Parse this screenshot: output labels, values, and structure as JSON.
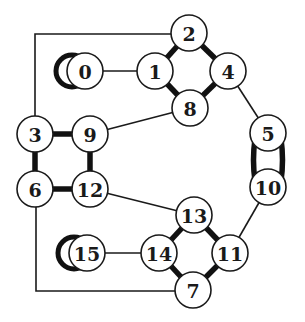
{
  "diagram": {
    "type": "graph",
    "node_radius": 18,
    "nodes": [
      {
        "id": "0",
        "label": "0",
        "x": 85,
        "y": 71
      },
      {
        "id": "1",
        "label": "1",
        "x": 155,
        "y": 71
      },
      {
        "id": "2",
        "label": "2",
        "x": 189,
        "y": 33
      },
      {
        "id": "3",
        "label": "3",
        "x": 35,
        "y": 134
      },
      {
        "id": "4",
        "label": "4",
        "x": 228,
        "y": 71
      },
      {
        "id": "5",
        "label": "5",
        "x": 268,
        "y": 133
      },
      {
        "id": "6",
        "label": "6",
        "x": 35,
        "y": 189
      },
      {
        "id": "7",
        "label": "7",
        "x": 193,
        "y": 290
      },
      {
        "id": "8",
        "label": "8",
        "x": 190,
        "y": 108
      },
      {
        "id": "9",
        "label": "9",
        "x": 90,
        "y": 134
      },
      {
        "id": "10",
        "label": "10",
        "x": 268,
        "y": 187
      },
      {
        "id": "11",
        "label": "11",
        "x": 230,
        "y": 253
      },
      {
        "id": "12",
        "label": "12",
        "x": 90,
        "y": 189
      },
      {
        "id": "13",
        "label": "13",
        "x": 194,
        "y": 215
      },
      {
        "id": "14",
        "label": "14",
        "x": 159,
        "y": 253
      },
      {
        "id": "15",
        "label": "15",
        "x": 87,
        "y": 253
      }
    ],
    "edges": [
      {
        "from": "0",
        "to": "1",
        "weight": "thin"
      },
      {
        "from": "1",
        "to": "2",
        "weight": "thick"
      },
      {
        "from": "1",
        "to": "8",
        "weight": "thick"
      },
      {
        "from": "2",
        "to": "4",
        "weight": "thick"
      },
      {
        "from": "4",
        "to": "8",
        "weight": "thick"
      },
      {
        "from": "4",
        "to": "5",
        "weight": "thin"
      },
      {
        "from": "8",
        "to": "9",
        "weight": "thin"
      },
      {
        "from": "2",
        "to": "3",
        "weight": "thin",
        "route": [
          [
            171,
            34
          ],
          [
            35,
            34
          ],
          [
            35,
            116
          ]
        ]
      },
      {
        "from": "3",
        "to": "9",
        "weight": "thick"
      },
      {
        "from": "3",
        "to": "6",
        "weight": "thick"
      },
      {
        "from": "9",
        "to": "12",
        "weight": "thick"
      },
      {
        "from": "6",
        "to": "12",
        "weight": "thick"
      },
      {
        "from": "12",
        "to": "13",
        "weight": "thin"
      },
      {
        "from": "6",
        "to": "7",
        "weight": "thin",
        "route": [
          [
            36,
            207
          ],
          [
            36,
            291
          ],
          [
            175,
            291
          ]
        ]
      },
      {
        "from": "5",
        "to": "10",
        "weight": "thick",
        "double": true
      },
      {
        "from": "10",
        "to": "11",
        "weight": "thin"
      },
      {
        "from": "13",
        "to": "14",
        "weight": "thick"
      },
      {
        "from": "13",
        "to": "11",
        "weight": "thick"
      },
      {
        "from": "14",
        "to": "7",
        "weight": "thick"
      },
      {
        "from": "11",
        "to": "7",
        "weight": "thick"
      },
      {
        "from": "15",
        "to": "14",
        "weight": "thin"
      }
    ],
    "self_loops": [
      {
        "node": "0",
        "cx": 72,
        "cy": 71,
        "r": 16
      },
      {
        "node": "15",
        "cx": 74,
        "cy": 253,
        "r": 16
      }
    ]
  }
}
